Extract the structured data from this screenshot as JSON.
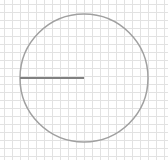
{
  "diagram": {
    "type": "circle-with-radius-on-grid",
    "canvas": {
      "width": 168,
      "height": 160
    },
    "grid": {
      "spacing": 8,
      "color": "#e2e2e2"
    },
    "circle": {
      "cx": 84,
      "cy": 78,
      "r": 64,
      "stroke": "#a0a0a0",
      "stroke_width": 1.5
    },
    "radius_line": {
      "x1": 20,
      "y1": 78,
      "x2": 84,
      "y2": 78,
      "stroke": "#808080",
      "stroke_width": 2
    }
  }
}
